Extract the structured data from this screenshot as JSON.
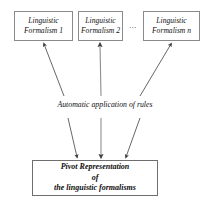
{
  "diagram": {
    "colors": {
      "box_border": "#8a8a8a",
      "pivot_border": "#6f6f6f",
      "arrow": "#555555",
      "text": "#111111",
      "background": "#ffffff"
    },
    "formalism_boxes": [
      {
        "id": "formalism-1",
        "line1": "Linguistic",
        "line2": "Formalism 1"
      },
      {
        "id": "formalism-2",
        "line1": "Linguistic",
        "line2": "Formalism 2"
      },
      {
        "id": "formalism-n",
        "line1": "Linguistic",
        "line2": "Formalism n"
      }
    ],
    "ellipsis": "...",
    "rules_label": "Automatic application of rules",
    "pivot_box": {
      "line1": "Pivot Representation",
      "line2": "of",
      "line3": "the linguistic formalisms"
    },
    "arrows": {
      "up_count": 3,
      "down_count": 3,
      "up_description": "arrows from rules label up to each linguistic formalism box",
      "down_description": "arrows from rules label down to the pivot representation box"
    }
  }
}
